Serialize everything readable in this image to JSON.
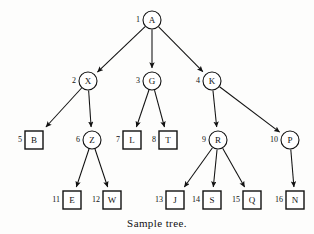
{
  "figure": {
    "caption": "Sample tree.",
    "top_clipped_text": "",
    "background_color": "#fdfdfc",
    "ink_color": "#111111"
  },
  "tree": {
    "nodes": [
      {
        "index": "1",
        "label": "A",
        "shape": "circle",
        "x": 152,
        "y": 20,
        "r": 9
      },
      {
        "index": "2",
        "label": "X",
        "shape": "circle",
        "x": 88,
        "y": 81,
        "r": 9
      },
      {
        "index": "3",
        "label": "G",
        "shape": "circle",
        "x": 152,
        "y": 81,
        "r": 9
      },
      {
        "index": "4",
        "label": "K",
        "shape": "circle",
        "x": 212,
        "y": 81,
        "r": 9
      },
      {
        "index": "5",
        "label": "B",
        "shape": "square",
        "x": 34,
        "y": 140,
        "r": 9
      },
      {
        "index": "6",
        "label": "Z",
        "shape": "circle",
        "x": 92,
        "y": 140,
        "r": 9
      },
      {
        "index": "7",
        "label": "L",
        "shape": "square",
        "x": 132,
        "y": 140,
        "r": 9
      },
      {
        "index": "8",
        "label": "T",
        "shape": "square",
        "x": 168,
        "y": 140,
        "r": 9
      },
      {
        "index": "9",
        "label": "R",
        "shape": "circle",
        "x": 218,
        "y": 140,
        "r": 9
      },
      {
        "index": "10",
        "label": "P",
        "shape": "circle",
        "x": 290,
        "y": 140,
        "r": 9
      },
      {
        "index": "11",
        "label": "E",
        "shape": "square",
        "x": 72,
        "y": 200,
        "r": 9
      },
      {
        "index": "12",
        "label": "W",
        "shape": "square",
        "x": 112,
        "y": 200,
        "r": 9
      },
      {
        "index": "13",
        "label": "J",
        "shape": "square",
        "x": 175,
        "y": 200,
        "r": 9
      },
      {
        "index": "14",
        "label": "S",
        "shape": "square",
        "x": 212,
        "y": 200,
        "r": 9
      },
      {
        "index": "15",
        "label": "Q",
        "shape": "square",
        "x": 252,
        "y": 200,
        "r": 9
      },
      {
        "index": "16",
        "label": "N",
        "shape": "square",
        "x": 295,
        "y": 200,
        "r": 9
      }
    ],
    "edges": [
      {
        "from": "A",
        "to": "X"
      },
      {
        "from": "A",
        "to": "G"
      },
      {
        "from": "A",
        "to": "K"
      },
      {
        "from": "X",
        "to": "B"
      },
      {
        "from": "X",
        "to": "Z"
      },
      {
        "from": "G",
        "to": "L"
      },
      {
        "from": "G",
        "to": "T"
      },
      {
        "from": "K",
        "to": "R"
      },
      {
        "from": "K",
        "to": "P"
      },
      {
        "from": "Z",
        "to": "E"
      },
      {
        "from": "Z",
        "to": "W"
      },
      {
        "from": "R",
        "to": "J"
      },
      {
        "from": "R",
        "to": "S"
      },
      {
        "from": "R",
        "to": "Q"
      },
      {
        "from": "P",
        "to": "N"
      }
    ]
  }
}
